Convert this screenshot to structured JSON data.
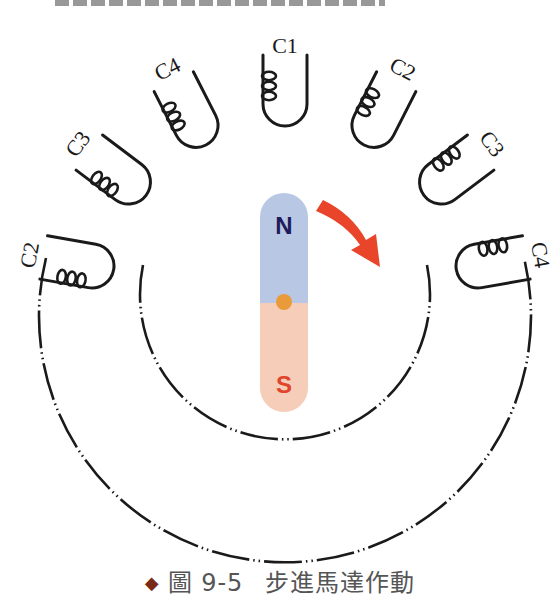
{
  "figure": {
    "caption_bullet": "◆",
    "caption_prefix": "圖 9-5",
    "caption_title": "步進馬達作動"
  },
  "coils": [
    {
      "label": "C2",
      "position": "left-outer",
      "angle_deg": -80
    },
    {
      "label": "C3",
      "position": "left-middle",
      "angle_deg": -53
    },
    {
      "label": "C4",
      "position": "left-inner",
      "angle_deg": -27
    },
    {
      "label": "C1",
      "position": "top",
      "angle_deg": 0
    },
    {
      "label": "C2",
      "position": "right-inner",
      "angle_deg": 27
    },
    {
      "label": "C3",
      "position": "right-middle",
      "angle_deg": 53
    },
    {
      "label": "C4",
      "position": "right-outer",
      "angle_deg": 80
    }
  ],
  "rotor": {
    "north_label": "N",
    "south_label": "S",
    "north_color": "#b8c8e4",
    "south_color": "#f6cdb8",
    "north_text_color": "#1e1b5c",
    "south_text_color": "#e0442a",
    "pivot_color": "#e99a3b"
  },
  "rotation_arrow": {
    "direction": "clockwise",
    "color": "#e8452a"
  },
  "stator": {
    "line_style": "dash-dot-dot",
    "line_color": "#1a1a1a"
  }
}
